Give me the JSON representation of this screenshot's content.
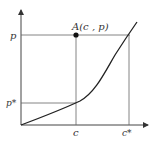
{
  "diagram": {
    "type": "function-plot",
    "axes": {
      "x_arrow": true,
      "y_arrow": true
    },
    "labels": {
      "y_top": "p",
      "y_low": "p*",
      "x_mid": "c",
      "x_right": "c*",
      "point": "A(c , p)"
    },
    "curve": "increasing convex curve from origin",
    "colors": {
      "line": "#333333",
      "guide": "#555555",
      "background": "#ffffff"
    }
  }
}
